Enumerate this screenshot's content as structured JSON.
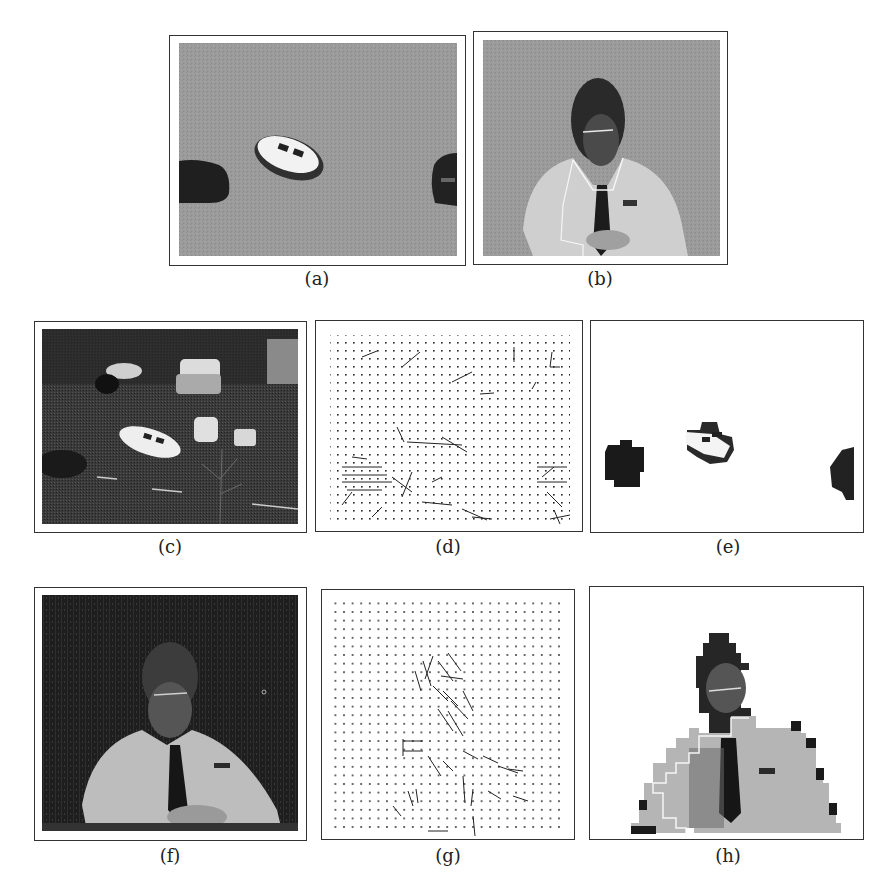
{
  "figure": {
    "panels": [
      {
        "id": "a",
        "label": "(a)",
        "content": "segmented moving cars on gray background"
      },
      {
        "id": "b",
        "label": "(b)",
        "content": "segmented person at desk on gray background with white boundary"
      },
      {
        "id": "c",
        "label": "(c)",
        "content": "street scene with cars"
      },
      {
        "id": "d",
        "label": "(d)",
        "content": "motion vector field, street scene"
      },
      {
        "id": "e",
        "label": "(e)",
        "content": "segmented cars on white background"
      },
      {
        "id": "f",
        "label": "(f)",
        "content": "person seated at desk"
      },
      {
        "id": "g",
        "label": "(g)",
        "content": "motion vector field, person scene"
      },
      {
        "id": "h",
        "label": "(h)",
        "content": "block-segmented person with white boundary"
      }
    ]
  },
  "colors": {
    "frame": "#333333",
    "gray_bg": "#9a9a9a",
    "dark_scene": "#2a2a2a",
    "page": "#ffffff"
  }
}
